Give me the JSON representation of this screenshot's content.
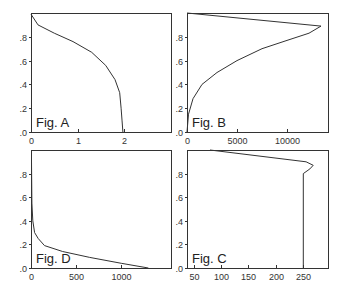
{
  "chart_data": [
    {
      "id": "A",
      "type": "line",
      "title": "Fig. A",
      "xlabel": "",
      "ylabel": "",
      "xlim": [
        0,
        3.0
      ],
      "ylim": [
        0,
        1.0
      ],
      "xticks": [
        0,
        1,
        2
      ],
      "xtick_labels": [
        "0",
        "1",
        "2"
      ],
      "yticks": [
        0,
        0.2,
        0.4,
        0.6,
        0.8
      ],
      "ytick_labels": [
        ".0",
        ".2",
        ".4",
        ".6",
        ".8"
      ],
      "grid": false,
      "series": [
        {
          "name": "A",
          "x": [
            0,
            0.15,
            0.5,
            0.9,
            1.3,
            1.6,
            1.8,
            1.9,
            1.93,
            1.95,
            1.97
          ],
          "y": [
            0.99,
            0.9,
            0.83,
            0.76,
            0.67,
            0.56,
            0.44,
            0.33,
            0.2,
            0.1,
            0.0
          ]
        }
      ]
    },
    {
      "id": "B",
      "type": "line",
      "title": "Fig. B",
      "xlabel": "",
      "ylabel": "",
      "xlim": [
        0,
        14100
      ],
      "ylim": [
        0,
        1.0
      ],
      "xticks": [
        0,
        5000,
        10000
      ],
      "xtick_labels": [
        "0",
        "5000",
        "10000"
      ],
      "yticks": [
        0,
        0.2,
        0.4,
        0.6,
        0.8
      ],
      "ytick_labels": [
        ".0",
        ".2",
        ".4",
        ".6",
        ".8"
      ],
      "grid": false,
      "series": [
        {
          "name": "B",
          "x": [
            0,
            150,
            600,
            1500,
            3000,
            5000,
            7500,
            10000,
            12200,
            13400,
            0
          ],
          "y": [
            0.0,
            0.15,
            0.28,
            0.4,
            0.5,
            0.6,
            0.7,
            0.77,
            0.83,
            0.89,
            1.0
          ]
        }
      ]
    },
    {
      "id": "D",
      "type": "line",
      "title": "Fig. D",
      "xlabel": "",
      "ylabel": "",
      "xlim": [
        0,
        1550
      ],
      "ylim": [
        0,
        1.0
      ],
      "xticks": [
        0,
        500,
        1000
      ],
      "xtick_labels": [
        "0",
        "500",
        "1000"
      ],
      "yticks": [
        0,
        0.2,
        0.4,
        0.6,
        0.8
      ],
      "ytick_labels": [
        ".0",
        ".2",
        ".4",
        ".6",
        ".8"
      ],
      "grid": false,
      "series": [
        {
          "name": "D",
          "x": [
            5,
            10,
            20,
            40,
            80,
            150,
            350,
            650,
            1000,
            1300
          ],
          "y": [
            0.9,
            0.55,
            0.4,
            0.3,
            0.25,
            0.19,
            0.14,
            0.09,
            0.04,
            0.0
          ]
        }
      ]
    },
    {
      "id": "C",
      "type": "line",
      "title": "Fig. C",
      "xlabel": "",
      "ylabel": "",
      "xlim": [
        38,
        295
      ],
      "ylim": [
        0,
        1.0
      ],
      "xticks": [
        50,
        100,
        150,
        200,
        250
      ],
      "xtick_labels": [
        "50",
        "100",
        "150",
        "200",
        "250"
      ],
      "yticks": [
        0,
        0.2,
        0.4,
        0.6,
        0.8
      ],
      "ytick_labels": [
        ".0",
        ".2",
        ".4",
        ".6",
        ".8"
      ],
      "grid": false,
      "series": [
        {
          "name": "C",
          "x": [
            250,
            250,
            262,
            268,
            255,
            80
          ],
          "y": [
            0.0,
            0.8,
            0.84,
            0.87,
            0.9,
            1.0
          ]
        }
      ]
    }
  ]
}
